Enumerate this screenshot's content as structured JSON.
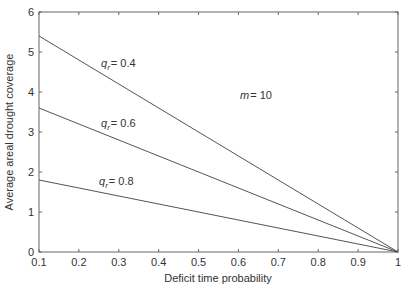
{
  "chart_data": {
    "type": "line",
    "title": "",
    "xlabel": "Deficit time probability",
    "ylabel": "Average areal drought coverage",
    "xlim": [
      0.1,
      1
    ],
    "ylim": [
      0,
      6
    ],
    "xticks": [
      "0.1",
      "0.2",
      "0.3",
      "0.4",
      "0.5",
      "0.6",
      "0.7",
      "0.8",
      "0.9",
      "1"
    ],
    "yticks": [
      "0",
      "1",
      "2",
      "3",
      "4",
      "5",
      "6"
    ],
    "grid": false,
    "legend": "none (inline annotations)",
    "series": [
      {
        "name": "q_r = 0.4",
        "x": [
          0.1,
          1
        ],
        "y": [
          5.4,
          0
        ]
      },
      {
        "name": "q_r = 0.6",
        "x": [
          0.1,
          1
        ],
        "y": [
          3.6,
          0
        ]
      },
      {
        "name": "q_r = 0.8",
        "x": [
          0.1,
          1
        ],
        "y": [
          1.8,
          0
        ]
      }
    ],
    "annotations": [
      {
        "text": "q_r = 0.4",
        "x": 0.29,
        "y": 4.5
      },
      {
        "text": "q_r = 0.6",
        "x": 0.29,
        "y": 3.0
      },
      {
        "text": "q_r = 0.8",
        "x": 0.29,
        "y": 1.85
      },
      {
        "text": "m = 10",
        "x": 0.65,
        "y": 4.1
      }
    ]
  },
  "labels": {
    "xlabel": "Deficit time probability",
    "ylabel": "Average areal drought coverage",
    "m_label": "m",
    "m_value": "= 10",
    "q_sym": "q",
    "q_sub": "r",
    "q04": "= 0.4",
    "q06": "= 0.6",
    "q08": "= 0.8"
  }
}
